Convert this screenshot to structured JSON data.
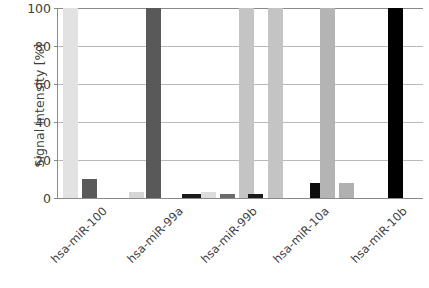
{
  "chart_data": {
    "type": "bar",
    "title": "",
    "subtitle": "",
    "xlabel": "",
    "ylabel": "Signal intensity [%]",
    "ylim": [
      0,
      100
    ],
    "yticks": [
      0,
      20,
      40,
      60,
      80,
      100
    ],
    "ytick_labels": [
      "0",
      "20",
      "40",
      "60",
      "80",
      "100"
    ],
    "grid": true,
    "legend": "none",
    "categories": [
      "hsa-miR-100",
      "hsa-miR-99a",
      "hsa-miR-99b",
      "hsa-miR-10a",
      "hsa-miR-10b"
    ],
    "series": [
      {
        "name": "probe hsa-miR-100",
        "color": "#e2e2e2",
        "values": [
          100,
          3,
          3,
          0,
          0
        ]
      },
      {
        "name": "probe hsa-miR-99a",
        "color": "#595959",
        "values": [
          10,
          100,
          2,
          0,
          0
        ]
      },
      {
        "name": "probe hsa-miR-99b",
        "color": "#c4c4c4",
        "values": [
          0,
          0,
          100,
          100,
          8
        ]
      },
      {
        "name": "probe hsa-miR-10a",
        "color": "#1a1a1a",
        "values": [
          0,
          2,
          2,
          2,
          8
        ]
      },
      {
        "name": "probe hsa-miR-10b",
        "color": "#000000",
        "values": [
          0,
          0,
          0,
          0,
          100
        ]
      }
    ],
    "bars": [
      {
        "group": "hsa-miR-100",
        "series": "probe hsa-miR-100",
        "value": 100,
        "color": "#e2e2e2"
      },
      {
        "group": "hsa-miR-100",
        "series": "probe hsa-miR-99a",
        "value": 10,
        "color": "#595959"
      },
      {
        "group": "hsa-miR-99a",
        "series": "probe hsa-miR-100",
        "value": 3,
        "color": "#d6d6d6"
      },
      {
        "group": "hsa-miR-99a",
        "series": "probe hsa-miR-99a",
        "value": 100,
        "color": "#595959"
      },
      {
        "group": "hsa-miR-99a",
        "series": "probe hsa-miR-10a",
        "value": 2,
        "color": "#1a1a1a"
      },
      {
        "group": "hsa-miR-99b",
        "series": "probe hsa-miR-10a",
        "value": 2,
        "color": "#1a1a1a"
      },
      {
        "group": "hsa-miR-99b",
        "series": "probe hsa-miR-100",
        "value": 3,
        "color": "#dcdcdc"
      },
      {
        "group": "hsa-miR-99b",
        "series": "probe hsa-miR-99a",
        "value": 2,
        "color": "#6b6b6b"
      },
      {
        "group": "hsa-miR-99b",
        "series": "probe hsa-miR-99b",
        "value": 100,
        "color": "#c4c4c4"
      },
      {
        "group": "hsa-miR-10a",
        "series": "probe hsa-miR-10a",
        "value": 2,
        "color": "#1a1a1a"
      },
      {
        "group": "hsa-miR-10a",
        "series": "probe hsa-miR-99b",
        "value": 100,
        "color": "#c4c4c4"
      },
      {
        "group": "hsa-miR-10a",
        "series": "probe hsa-miR-10b",
        "value": 8,
        "color": "#0d0d0d"
      },
      {
        "group": "hsa-miR-10b",
        "series": "probe hsa-miR-99b",
        "value": 100,
        "color": "#b4b4b4"
      },
      {
        "group": "hsa-miR-10b",
        "series": "probe hsa-miR-10a",
        "value": 8,
        "color": "#b0b0b0"
      },
      {
        "group": "hsa-miR-10b",
        "series": "probe hsa-miR-10b",
        "value": 100,
        "color": "#000000"
      }
    ]
  },
  "axis": {
    "y_title": "Signal intensity [%]"
  },
  "colors": {
    "axis_line": "#8a8a8a",
    "gridline": "#b9b9b9",
    "text": "#3d3d3d",
    "background": "#ffffff"
  }
}
